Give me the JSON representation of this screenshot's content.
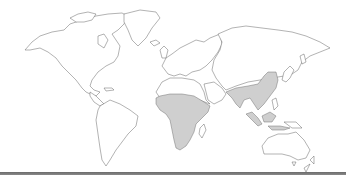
{
  "map": {
    "type": "world-outline",
    "projection": "equirectangular-like",
    "colors": {
      "background": "#ffffff",
      "land_fill": "#ffffff",
      "outline": "#555555",
      "highlight_fill": "#cfcfcf",
      "bottom_rule": "#6a6a6a"
    },
    "highlighted_regions": [
      {
        "name": "Sub-Saharan Africa"
      },
      {
        "name": "South Asia"
      },
      {
        "name": "East Asia"
      },
      {
        "name": "Southeast Asia"
      }
    ],
    "continents": [
      "North America",
      "Greenland",
      "South America",
      "Europe",
      "Africa",
      "Asia",
      "Australia",
      "New Zealand"
    ]
  }
}
